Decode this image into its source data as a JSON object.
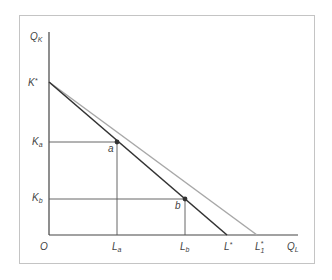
{
  "diagram": {
    "axes": {
      "y_label": "Q",
      "y_sub": "K",
      "x_label": "Q",
      "x_sub": "L",
      "origin": "O"
    },
    "y_ticks": [
      {
        "main": "K",
        "sub": "*",
        "y": 82
      },
      {
        "main": "K",
        "sub": "a",
        "y": 142
      },
      {
        "main": "K",
        "sub": "b",
        "y": 199
      }
    ],
    "x_ticks": [
      {
        "main": "L",
        "sub": "a",
        "x": 117
      },
      {
        "main": "L",
        "sub": "b",
        "x": 185
      },
      {
        "main": "L",
        "sub": "*",
        "x": 227
      },
      {
        "main": "L",
        "sub": "1",
        "sup": "*",
        "x": 257
      }
    ],
    "points": [
      {
        "label": "a",
        "x": 117,
        "y": 142
      },
      {
        "label": "b",
        "x": 185,
        "y": 199
      }
    ],
    "lines": [
      {
        "name": "isocost-original",
        "from": "K*",
        "to": "L*",
        "color": "#333333"
      },
      {
        "name": "isocost-new",
        "from": "K*",
        "to": "L1*",
        "color": "#a8a8a8"
      }
    ]
  }
}
